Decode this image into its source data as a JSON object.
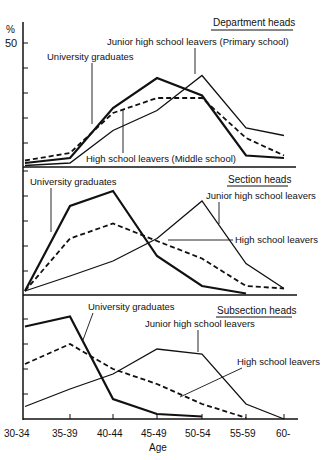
{
  "chart_data": {
    "type": "line",
    "title": "",
    "xlabel": "Age",
    "ylabel": "%",
    "y_tick_label": "50",
    "categories": [
      "30-34",
      "35-39",
      "40-44",
      "45-49",
      "50-54",
      "55-59",
      "60-"
    ],
    "grid": false,
    "legend": "inline annotations with pointer lines",
    "ylim": [
      0,
      50
    ],
    "panels": [
      {
        "title": "Department heads",
        "series": [
          {
            "name": "University graduates",
            "style": "thick-solid",
            "values": [
              2,
              4,
              24,
              36,
              29,
              5,
              4
            ]
          },
          {
            "name": "High school leavers (Middle school)",
            "style": "dashed",
            "values": [
              3,
              6,
              22,
              28,
              28,
              12,
              5
            ]
          },
          {
            "name": "Junior high school leavers (Primary school)",
            "style": "thin-solid",
            "values": [
              1,
              2,
              15,
              23,
              37,
              16,
              13
            ]
          }
        ],
        "annotations": [
          {
            "text": "University graduates",
            "x": 47,
            "y": 60,
            "arrow_to": [
              92,
              124
            ]
          },
          {
            "text": "Junior high school leavers (Primary school)",
            "x": 107,
            "y": 45,
            "arrow_to": [
              195,
              74
            ]
          },
          {
            "text": "High school leavers (Middle school)",
            "x": 86,
            "y": 162,
            "arrow_to": [
              123,
              109
            ]
          }
        ]
      },
      {
        "title": "Section heads",
        "series": [
          {
            "name": "University graduates",
            "style": "thick-solid",
            "values": [
              2,
              36,
              42,
              16,
              4,
              1,
              null
            ]
          },
          {
            "name": "High school leavers",
            "style": "dashed",
            "values": [
              2,
              23,
              29,
              22,
              15,
              4,
              3
            ]
          },
          {
            "name": "Junior high school leavers",
            "style": "thin-solid",
            "values": [
              2,
              8,
              14,
              23,
              38,
              13,
              3
            ]
          }
        ],
        "annotations": [
          {
            "text": "University graduates",
            "x": 30,
            "y": 185,
            "arrow_to": [
              51,
              232
            ]
          },
          {
            "text": "Junior high school leavers",
            "x": 206,
            "y": 199,
            "arrow_to": [
              219,
              224
            ]
          },
          {
            "text": "High school leavers",
            "x": 235,
            "y": 243,
            "arrow_to": [
              168,
              240
            ]
          }
        ]
      },
      {
        "title": "Subsection heads",
        "series": [
          {
            "name": "University graduates",
            "style": "thick-solid",
            "values": [
              37,
              41,
              8,
              2,
              1,
              null,
              null
            ]
          },
          {
            "name": "High school leavers",
            "style": "dashed",
            "values": [
              22,
              30,
              20,
              14,
              6,
              0.5,
              null
            ]
          },
          {
            "name": "Junior high school leavers",
            "style": "thin-solid",
            "values": [
              5,
              12,
              18,
              28,
              26,
              6,
              0
            ]
          }
        ],
        "annotations": [
          {
            "text": "University graduates",
            "x": 88,
            "y": 310,
            "arrow_to": [
              83,
              340
            ]
          },
          {
            "text": "Junior high school leavers",
            "x": 145,
            "y": 327,
            "arrow_to": [
              198,
              352
            ]
          },
          {
            "text": "High school leavers",
            "x": 237,
            "y": 365,
            "arrow_to": [
              180,
              397
            ]
          }
        ]
      }
    ]
  }
}
